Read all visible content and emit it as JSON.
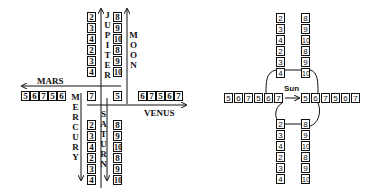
{
  "left_diagram": {
    "jupiter": {
      "label": "JUPITER",
      "values": [
        "2",
        "3",
        "4",
        "2",
        "3",
        "4"
      ]
    },
    "moon": {
      "label": "MOON",
      "values": [
        "8",
        "9",
        "10",
        "8",
        "9",
        "10"
      ]
    },
    "mars": {
      "label": "MARS",
      "values": [
        "5",
        "6",
        "7",
        "5",
        "6"
      ]
    },
    "venus": {
      "label": "VENUS",
      "values": [
        "6",
        "7",
        "5",
        "6",
        "7"
      ]
    },
    "mercury": {
      "label": "MERCURY",
      "values": [
        "2",
        "3",
        "4",
        "2",
        "3",
        "4"
      ]
    },
    "saturn": {
      "label": "SATURN",
      "values": [
        "8",
        "9",
        "10",
        "8",
        "9",
        "10"
      ]
    },
    "center": {
      "left_value": "7",
      "right_value": "5"
    }
  },
  "right_diagram": {
    "sun_label": "Sun",
    "top_left": [
      "2",
      "3",
      "4",
      "2",
      "3",
      "4"
    ],
    "top_right": [
      "8",
      "9",
      "10",
      "8",
      "9",
      "10"
    ],
    "row_left": [
      "5",
      "6",
      "7",
      "5",
      "6",
      "7"
    ],
    "row_right": [
      "5",
      "6",
      "7",
      "5",
      "6",
      "7"
    ],
    "bottom_left": [
      "2",
      "3",
      "4",
      "2",
      "3",
      "4"
    ],
    "bottom_right": [
      "8",
      "9",
      "10",
      "8",
      "9",
      "10"
    ]
  }
}
